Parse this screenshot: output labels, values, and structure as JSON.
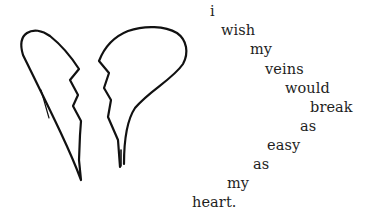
{
  "illustration": {
    "subject": "broken-heart",
    "stroke_color": "#111111",
    "background": "#ffffff"
  },
  "poem": {
    "words": [
      {
        "text": "i",
        "x": 210,
        "y": 4
      },
      {
        "text": "wish",
        "x": 221,
        "y": 23
      },
      {
        "text": "my",
        "x": 250,
        "y": 42
      },
      {
        "text": "veins",
        "x": 265,
        "y": 62
      },
      {
        "text": "would",
        "x": 285,
        "y": 81
      },
      {
        "text": "break",
        "x": 310,
        "y": 100
      },
      {
        "text": "as",
        "x": 300,
        "y": 119
      },
      {
        "text": "easy",
        "x": 267,
        "y": 138
      },
      {
        "text": "as",
        "x": 253,
        "y": 157
      },
      {
        "text": "my",
        "x": 227,
        "y": 176
      },
      {
        "text": "heart.",
        "x": 192,
        "y": 195
      }
    ]
  }
}
